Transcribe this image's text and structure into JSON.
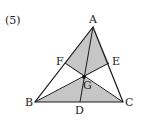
{
  "problem_label": "(5)",
  "colors": {
    "shade": "#c6c6c6",
    "line": "#1a1a1a",
    "background": "#ffffff"
  },
  "points": {
    "A": {
      "label": "A",
      "x": 93,
      "y": 27
    },
    "B": {
      "label": "B",
      "x": 35,
      "y": 102
    },
    "C": {
      "label": "C",
      "x": 123,
      "y": 102
    },
    "D": {
      "label": "D",
      "x": 80,
      "y": 102
    },
    "E": {
      "label": "E",
      "x": 109,
      "y": 63
    },
    "F": {
      "label": "F",
      "x": 65,
      "y": 63
    },
    "G": {
      "label": "G",
      "x": 84,
      "y": 77
    }
  },
  "shaded_regions": [
    "AFGE",
    "BGC"
  ]
}
